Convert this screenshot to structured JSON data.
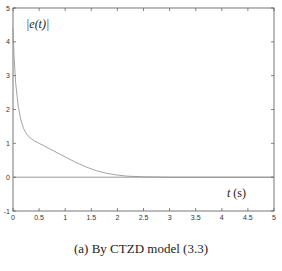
{
  "chart_data": {
    "type": "line",
    "title": "",
    "xlabel": "t (s)",
    "ylabel": "|e(t)|",
    "xlim": [
      0,
      5
    ],
    "ylim": [
      -1,
      5
    ],
    "grid": false,
    "legend": null,
    "x_ticks": [
      "0",
      "0.5",
      "1",
      "1.5",
      "2",
      "2.5",
      "3",
      "3.5",
      "4",
      "4.5",
      "5"
    ],
    "y_ticks": [
      "-1",
      "0",
      "1",
      "2",
      "3",
      "4",
      "5"
    ],
    "series": [
      {
        "name": "|e(t)|",
        "x": [
          0,
          0.02,
          0.05,
          0.1,
          0.15,
          0.2,
          0.25,
          0.3,
          0.4,
          0.5,
          0.6,
          0.7,
          0.8,
          0.9,
          1.0,
          1.2,
          1.4,
          1.6,
          1.8,
          2.0,
          2.2,
          2.5,
          3.0,
          3.5,
          4.0,
          4.5,
          5.0
        ],
        "y": [
          4.4,
          3.6,
          2.8,
          2.1,
          1.7,
          1.45,
          1.3,
          1.2,
          1.08,
          1.0,
          0.92,
          0.84,
          0.76,
          0.68,
          0.6,
          0.44,
          0.3,
          0.19,
          0.11,
          0.06,
          0.03,
          0.01,
          0.0,
          0.0,
          0.0,
          0.0,
          0.0
        ]
      },
      {
        "name": "zero reference",
        "x": [
          0,
          5
        ],
        "y": [
          0,
          0
        ]
      }
    ]
  },
  "labels": {
    "ylabel": "|e(t)|",
    "xlabel_var": "t",
    "xlabel_unit": " (s)",
    "caption": "(a) By CTZD model (3.3)"
  },
  "colors": {
    "curve": "#9a9a9a",
    "axis": "#555555",
    "zero_line": "#8c8c8c"
  }
}
